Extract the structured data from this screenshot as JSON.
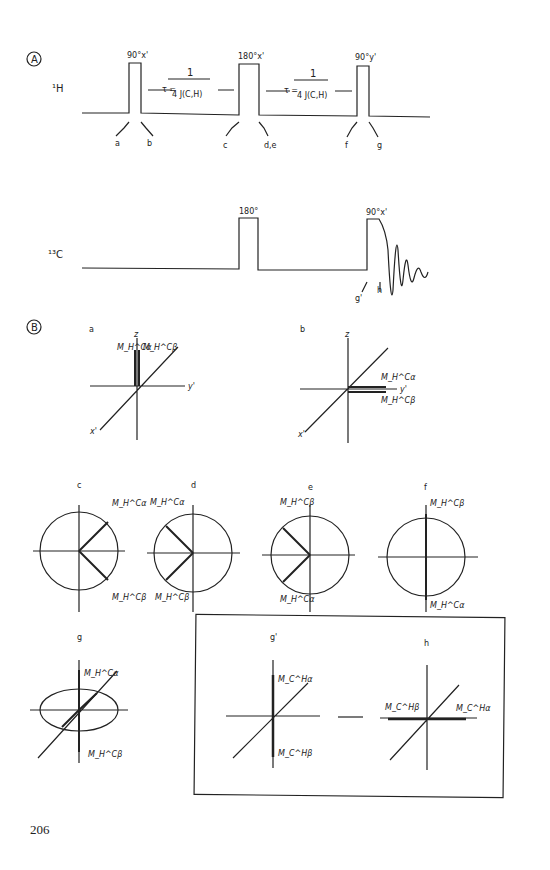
{
  "panel_a": {
    "label": "A",
    "h_channel": "¹H",
    "c_channel": "¹³C",
    "h_pulses": [
      "90°x'",
      "180°x'",
      "90°y'"
    ],
    "c_pulses": [
      "180°",
      "90°x'"
    ],
    "delay_num": "1",
    "delay_lhs": "τ =",
    "delay_den": "4 J(C,H)",
    "time_points_h": [
      "a",
      "b",
      "c",
      "d,e",
      "f",
      "g"
    ],
    "time_points_c": [
      "g'",
      "h"
    ]
  },
  "panel_b": {
    "label": "B",
    "diagrams": [
      "a",
      "b",
      "c",
      "d",
      "e",
      "f",
      "g",
      "g'",
      "h"
    ],
    "axes": {
      "z": "z",
      "x": "x'",
      "y": "y'"
    },
    "vectors": {
      "h_alpha": "M_H^Cα",
      "h_beta": "M_H^Cβ",
      "c_alpha": "M_C^Hα",
      "c_beta": "M_C^Hβ"
    }
  },
  "page_number": "206"
}
